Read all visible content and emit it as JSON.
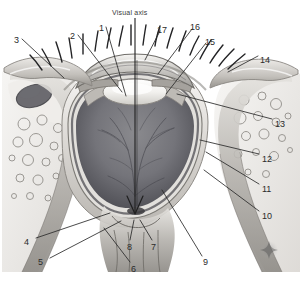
{
  "figure": {
    "kind": "anatomical-illustration",
    "style": "grayscale pencil/airbrush medical illustration",
    "width": 301,
    "height": 281,
    "background_color": "#ffffff",
    "ink_color": "#2b2b2b",
    "vitreous_color": "#6e6e72",
    "sclera_color": "#d8d6d2",
    "lens_color": "#f0efec",
    "fat_color": "#e9e7e4"
  },
  "axis": {
    "label": "Visual axis",
    "label_x": 112,
    "label_y": 9,
    "line_top_y": 18,
    "line_bottom_y": 216,
    "line_x": 135,
    "arrowhead": "down"
  },
  "watermark": {
    "name": "sparkle-star",
    "x": 269,
    "y": 250,
    "size": 18,
    "color": "#8a8a8a"
  },
  "labels": [
    {
      "id": "1",
      "text": "1",
      "x": 99,
      "y": 24,
      "anchor_x": 126,
      "anchor_y": 96,
      "side": "top"
    },
    {
      "id": "2",
      "text": "2",
      "x": 70,
      "y": 32,
      "anchor_x": 122,
      "anchor_y": 92,
      "side": "top"
    },
    {
      "id": "3",
      "text": "3",
      "x": 14,
      "y": 36,
      "anchor_x": 62,
      "anchor_y": 77,
      "side": "left"
    },
    {
      "id": "4",
      "text": "4",
      "x": 24,
      "y": 238,
      "anchor_x": 110,
      "anchor_y": 213,
      "side": "bottom-left"
    },
    {
      "id": "5",
      "text": "5",
      "x": 38,
      "y": 258,
      "anchor_x": 121,
      "anchor_y": 221,
      "side": "bottom-left"
    },
    {
      "id": "6",
      "text": "6",
      "x": 131,
      "y": 265,
      "anchor_x": 104,
      "anchor_y": 228,
      "side": "bottom"
    },
    {
      "id": "7",
      "text": "7",
      "x": 151,
      "y": 243,
      "anchor_x": 139,
      "anchor_y": 219,
      "side": "bottom"
    },
    {
      "id": "8",
      "text": "8",
      "x": 127,
      "y": 243,
      "anchor_x": 133,
      "anchor_y": 219,
      "side": "bottom"
    },
    {
      "id": "9",
      "text": "9",
      "x": 203,
      "y": 258,
      "anchor_x": 162,
      "anchor_y": 190,
      "side": "bottom-right"
    },
    {
      "id": "10",
      "text": "10",
      "x": 262,
      "y": 212,
      "anchor_x": 204,
      "anchor_y": 170,
      "side": "right"
    },
    {
      "id": "11",
      "text": "11",
      "x": 262,
      "y": 185,
      "anchor_x": 206,
      "anchor_y": 152,
      "side": "right"
    },
    {
      "id": "12",
      "text": "12",
      "x": 262,
      "y": 155,
      "anchor_x": 200,
      "anchor_y": 140,
      "side": "right"
    },
    {
      "id": "13",
      "text": "13",
      "x": 275,
      "y": 120,
      "anchor_x": 177,
      "anchor_y": 94,
      "side": "right"
    },
    {
      "id": "14",
      "text": "14",
      "x": 260,
      "y": 56,
      "anchor_x": 228,
      "anchor_y": 72,
      "side": "right"
    },
    {
      "id": "15",
      "text": "15",
      "x": 205,
      "y": 38,
      "anchor_x": 166,
      "anchor_y": 94,
      "side": "top-right"
    },
    {
      "id": "16",
      "text": "16",
      "x": 190,
      "y": 23,
      "anchor_x": 158,
      "anchor_y": 74,
      "side": "top-right"
    },
    {
      "id": "17",
      "text": "17",
      "x": 157,
      "y": 26,
      "anchor_x": 145,
      "anchor_y": 60,
      "side": "top-right"
    }
  ]
}
